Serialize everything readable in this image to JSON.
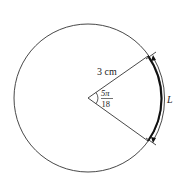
{
  "diagram": {
    "radius_label": "3 cm",
    "angle_numerator": "5π",
    "angle_denominator": "18",
    "arc_label": "L",
    "colors": {
      "stroke": "#333333",
      "arc": "#111111",
      "background": "#ffffff"
    }
  }
}
